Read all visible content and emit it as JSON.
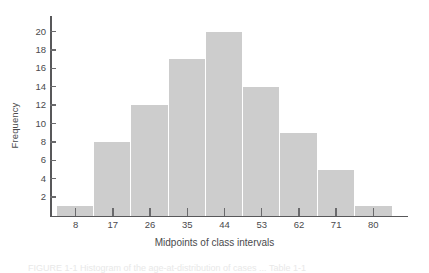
{
  "chart_data": {
    "type": "bar",
    "title": "",
    "subtitle": "",
    "xlabel": "Midpoints of class intervals",
    "ylabel": "Frequency",
    "categories": [
      "8",
      "17",
      "26",
      "35",
      "44",
      "53",
      "62",
      "71",
      "80"
    ],
    "values": [
      1,
      8,
      12,
      17,
      20,
      14,
      9,
      5,
      1
    ],
    "yticks": [
      2,
      4,
      6,
      8,
      10,
      12,
      14,
      16,
      18,
      20
    ],
    "ylim": [
      0,
      21.7
    ],
    "xlim_note": "contiguous histogram bars, ticks at bar midpoints",
    "grid": false,
    "legend": null,
    "annotations": [],
    "colors": {
      "bar_fill": "#cdcdcd",
      "bar_separator": "#ffffff",
      "axis": "#58585a",
      "tick": "#6a6a6c",
      "text": "#4a4a4c",
      "background": "#ffffff"
    }
  },
  "caption": {
    "text": "FIGURE 1-1  Histogram of the age-at-distribution of cases ... Table 1-1"
  }
}
